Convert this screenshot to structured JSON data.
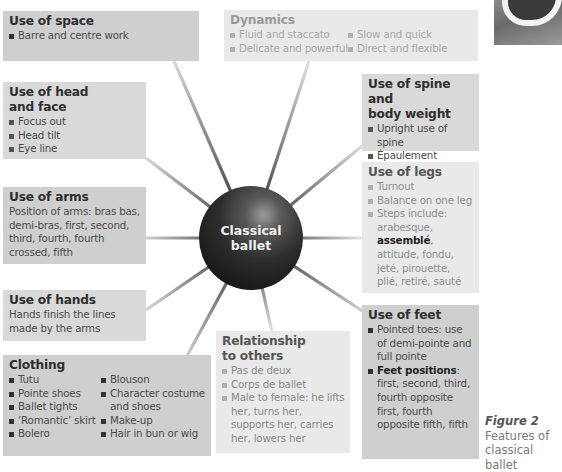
{
  "center": {
    "line1": "Classical",
    "line2": "ballet"
  },
  "boxes": {
    "space": {
      "title": "Use of space",
      "items": [
        "Barre and centre work"
      ]
    },
    "dynamics": {
      "title": "Dynamics",
      "col1": [
        "Fluid and staccato",
        "Delicate and powerful"
      ],
      "col2": [
        "Slow and quick",
        "Direct and flexible"
      ]
    },
    "head": {
      "title_line1": "Use of head",
      "title_line2": "and face",
      "items": [
        "Focus out",
        "Head tilt",
        "Eye line"
      ]
    },
    "spine": {
      "title_line1": "Use of spine and",
      "title_line2": "body weight",
      "items": [
        "Upright use of spine",
        "Épaulement",
        "Penché"
      ]
    },
    "arms": {
      "title": "Use of arms",
      "text": "Position of arms: bras bas, demi-bras, first, second, third, fourth, fourth crossed, fifth"
    },
    "legs": {
      "title": "Use of legs",
      "items": [
        "Turnout",
        "Balance on one leg"
      ],
      "steps_prefix": "Steps include: arabesque, ",
      "steps_bold": "assemblé",
      "steps_suffix": ", attitude, fondu, jeté, pirouette, plié, retiré, sauté"
    },
    "hands": {
      "title": "Use of hands",
      "text": "Hands finish the lines made by the arms"
    },
    "clothing": {
      "title": "Clothing",
      "col1": [
        "Tutu",
        "Pointe shoes",
        "Ballet tights",
        "‘Romantic’ skirt",
        "Bolero"
      ],
      "col2": [
        "Blouson",
        "Character costume and shoes",
        "Make-up",
        "Hair in bun or wig"
      ]
    },
    "relationship": {
      "title_line1": "Relationship",
      "title_line2": "to others",
      "items": [
        "Pas de deux",
        "Corps de ballet",
        "Male to female: he lifts her, turns her, supports her, carries her, lowers her"
      ]
    },
    "feet": {
      "title": "Use of feet",
      "item1": "Pointed toes: use of demi-pointe and full pointe",
      "item2_bold": "Feet positions",
      "item2_rest": ": first, second, third, fourth opposite first, fourth opposite fifth, fifth"
    }
  },
  "caption": {
    "figure": "Figure 2",
    "line1": "Features of",
    "line2": "classical ballet"
  },
  "photo": {
    "icon": "ballet-shoe-photo"
  }
}
